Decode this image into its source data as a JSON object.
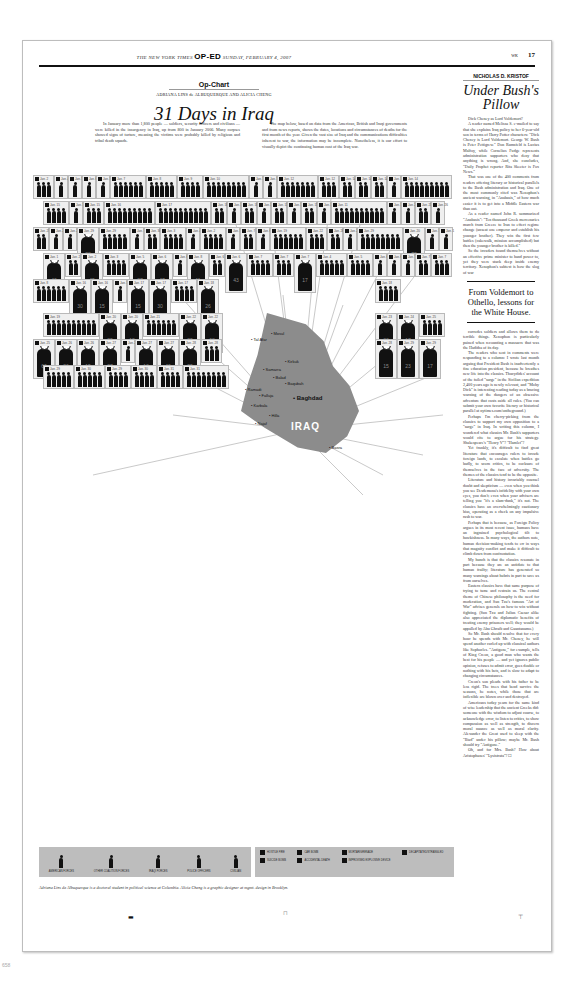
{
  "masthead": {
    "paper": "THE NEW YORK TIMES",
    "section": "OP-ED",
    "date": "SUNDAY, FEBRUARY 4, 2007",
    "section_code": "WK",
    "page": "17"
  },
  "opchart": {
    "kicker": "Op-Chart",
    "byline": "ADRIANA LINS de ALBUQUERQUE AND ALICIA CHENG",
    "title": "31 Days in Iraq",
    "intro": [
      "In January more than 1,800 people — soldiers, security officers and civilians — were killed in the insurgency in Iraq, up from 800 in January 2006. Many corpses showed signs of torture, meaning the victims were probably killed by religious and tribal death squads.",
      "The map below, based on data from the American, British and Iraqi governments and from news reports, shows the dates, locations and circumstances of deaths for the first month of the year. Given the vast size of Iraq and the communications difficulties inherent to war, the information may be incomplete. Nonetheless, it is our effort to visually depict the continuing human cost of the Iraq war."
    ],
    "map": {
      "country_label": "IRAQ",
      "cities": [
        "Mosul",
        "Tal Afar",
        "Kirkuk",
        "Samarra",
        "Baqubah",
        "Ramadi",
        "Falluja",
        "Baghdad",
        "Karbala",
        "Hilla",
        "Najaf",
        "Balad",
        "Basra"
      ]
    },
    "cells": [
      {
        "date": "Jan. 2",
        "n": 3
      },
      {
        "date": "Jan. 4",
        "n": 1
      },
      {
        "date": "Jan. 5",
        "n": 1
      },
      {
        "date": "Jan. 6",
        "n": 1
      },
      {
        "date": "Jan. 7",
        "n": 1
      },
      {
        "date": "Jan. 7",
        "n": 6
      },
      {
        "date": "Jan. 8",
        "n": 5
      },
      {
        "date": "Jan. 9",
        "n": 4
      },
      {
        "date": "Jan. 10",
        "n": 8
      },
      {
        "date": "Jan. 11",
        "n": 1
      },
      {
        "date": "Jan. 13",
        "n": 1
      },
      {
        "date": "Jan. 12",
        "n": 7
      },
      {
        "date": "Jan. 12",
        "n": 3
      },
      {
        "date": "Jan. 14",
        "n": 2
      },
      {
        "date": "Jan. 14",
        "n": 2
      },
      {
        "date": "Jan. 14",
        "n": 2
      },
      {
        "date": "Jan. 14",
        "n": 1
      },
      {
        "date": "Jan. 14",
        "n": 9
      },
      {
        "date": "Jan. 15",
        "n": 4
      },
      {
        "date": "Jan. 15",
        "n": 1
      },
      {
        "date": "Jan. 15",
        "n": 3
      },
      {
        "date": "Jan. 16",
        "n": 9
      },
      {
        "date": "Jan. 17",
        "n": 10
      },
      {
        "date": "Jan. 18",
        "n": 2
      },
      {
        "date": "Jan. 18",
        "n": 1
      },
      {
        "date": "Jan. 18",
        "n": 2
      },
      {
        "date": "Jan. 3",
        "n": 1
      },
      {
        "date": "Jan. 13",
        "n": 2
      },
      {
        "date": "Jan. 14",
        "n": 1
      },
      {
        "date": "Jan. 15",
        "n": 2
      },
      {
        "date": "Jan. 16",
        "n": 1
      },
      {
        "date": "Jan. 11",
        "n": 10
      },
      {
        "date": "Jan. 19",
        "n": 1
      },
      {
        "date": "Jan. 21",
        "n": 1
      },
      {
        "date": "Jan. 23",
        "n": 2
      },
      {
        "date": "Jan. 26",
        "n": 1
      },
      {
        "date": "Jan. 27",
        "n": 2
      },
      {
        "date": "Jan. 28",
        "n": 1
      },
      {
        "date": "Jan. 29",
        "n": 1
      },
      {
        "date": "Jan. 29",
        "big": 28
      },
      {
        "date": "Jan. 29",
        "n": 5
      },
      {
        "date": "Jan. 7",
        "n": 1
      },
      {
        "date": "Jan. 30",
        "n": 2
      },
      {
        "date": "Jan. 3",
        "n": 4
      },
      {
        "date": "Jan. 4",
        "n": 1
      },
      {
        "date": "Jan. 2",
        "n": 4
      },
      {
        "date": "Jan. 1",
        "n": 1
      },
      {
        "date": "Jan. 7",
        "n": 2
      },
      {
        "date": "Jan. 6",
        "n": 1
      },
      {
        "date": "Jan. 19",
        "n": 6
      },
      {
        "date": "Jan. 22",
        "n": 3
      },
      {
        "date": "Jan. 26",
        "n": 2
      },
      {
        "date": "Jan. 28",
        "n": 1
      },
      {
        "date": "Jan. 29",
        "n": 8
      },
      {
        "date": "Jan. 20",
        "big": 72
      },
      {
        "date": "Jan. 1",
        "n": 1
      },
      {
        "date": "Jan. 1",
        "n": 1
      },
      {
        "date": "Jan. 1",
        "big": 40
      },
      {
        "date": "Jan. 2",
        "n": 2
      },
      {
        "date": "Jan. 2",
        "big": 45
      },
      {
        "date": "Jan. 3",
        "n": 4
      },
      {
        "date": "Jan. 5",
        "big": 27
      },
      {
        "date": "Jan. 6",
        "big": 47
      },
      {
        "date": "Jan. 6",
        "n": 1
      },
      {
        "date": "Jan. 8",
        "big": 11
      },
      {
        "date": "Jan. 6",
        "n": 2
      },
      {
        "date": "Jan. 6",
        "big": 43
      },
      {
        "date": "Jan. 7",
        "n": 4
      },
      {
        "date": "Jan. 7",
        "n": 3
      },
      {
        "date": "Jan. 7",
        "big": 17
      },
      {
        "date": "Jan. 4",
        "n": 5
      },
      {
        "date": "Jan. 5",
        "n": 4
      },
      {
        "date": "Jan. 6",
        "n": 1
      },
      {
        "date": "Jan. 6",
        "n": 1
      },
      {
        "date": "Jan. 7",
        "n": 1
      },
      {
        "date": "Jan. 7",
        "n": 2
      },
      {
        "date": "Jan. 7",
        "n": 3
      },
      {
        "date": "Jan. 8",
        "n": 6
      },
      {
        "date": "Jan. 16",
        "big": 30
      },
      {
        "date": "Jan. 16",
        "big": 15
      },
      {
        "date": "Jan. 17",
        "n": 1
      },
      {
        "date": "Jan. 17",
        "big": 15
      },
      {
        "date": "Jan. 17",
        "big": 30
      },
      {
        "date": "Jan. 17",
        "n": 4
      },
      {
        "date": "Jan. 18",
        "big": 26
      },
      {
        "date": "Jan. 18",
        "n": 4
      },
      {
        "date": "Jan. 19",
        "n": 10
      },
      {
        "date": "Jan. 20",
        "big": 29
      },
      {
        "date": "Jan. 20",
        "big": 12
      },
      {
        "date": "Jan. 21",
        "n": 6
      },
      {
        "date": "Jan. 22",
        "big": 29
      },
      {
        "date": "Jan. 22",
        "big": 68
      },
      {
        "date": "Jan. 23",
        "big": 33
      },
      {
        "date": "Jan. 24",
        "big": 17
      },
      {
        "date": "Jan. 25",
        "n": 4
      },
      {
        "date": "Jan. 25",
        "big": 60
      },
      {
        "date": "Jan. 26",
        "big": 26
      },
      {
        "date": "Jan. 26",
        "big": 15
      },
      {
        "date": "Jan. 27",
        "big": 27
      },
      {
        "date": "Jan. 26",
        "n": 1
      },
      {
        "date": "Jan. 27",
        "big": 13
      },
      {
        "date": "Jan. 27",
        "big": 40
      },
      {
        "date": "Jan. 28",
        "big": 29
      },
      {
        "date": "Jan. 28",
        "n": 3
      },
      {
        "date": "Jan. 28",
        "big": 15
      },
      {
        "date": "Jan. 29",
        "big": 23
      },
      {
        "date": "Jan. 29",
        "big": 17
      },
      {
        "date": "Jan. 29",
        "n": 5
      },
      {
        "date": "Jan. 30",
        "n": 5
      },
      {
        "date": "Jan. 29",
        "n": 4
      },
      {
        "date": "Jan. 30",
        "n": 4
      },
      {
        "date": "Jan. 31",
        "n": 4
      },
      {
        "date": "Jan. 31",
        "n": 8
      }
    ]
  },
  "legend": {
    "forces": [
      "AMERICAN FORCES",
      "OTHER COALITION FORCES",
      "IRAQI FORCES",
      "POLICE OFFICERS",
      "CIVILIAN"
    ],
    "causes": [
      "HOSTILE FIRE",
      "CAR BOMB",
      "MORTAR/GRENADE",
      "DECAPITATED/STRANGLED",
      "SUICIDE BOMB",
      "ACCIDENTAL DEATH",
      "IMPROVISED EXPLOSIVE DEVICE"
    ]
  },
  "credit": "Adriana Lins de Albuquerque is a doctoral student in political science at Columbia. Alicia Cheng is a graphic designer at mgmt. design in Brooklyn.",
  "column": {
    "author": "NICHOLAS D. KRISTOF",
    "headline": "Under Bush's Pillow",
    "pull_quote": "From Voldemort to Othello, lessons for the White House.",
    "body_top": [
      "Dick Cheney as Lord Voldemort?",
      "A reader named Melissa S. e-mailed to say that she explains Iraq policy to her 6-year-old son in terms of Harry Potter characters: \"Dick Cheney is Lord Voldemort. George W. Bush is Peter Pettigrew.\" Don Rumsfeld is Lucius Malfoy, while Cornelius Fudge represents administration supporters who deny that anything is wrong. And, she concludes, \"Daily Prophet reporter Rita Skeeter is Fox News.\"",
      "That was one of the 400 comments from readers offering literary or historical parallels to the Bush administration and Iraq. One of the most commonly cited was Xenophon's ancient warning, in \"Anabasis,\" of how much easier it is to get into a Middle Eastern war than out.",
      "As a reader named John R. summarized \"Anabasis\": \"Ten thousand Greek mercenaries march from Greece to Iran to effect regime change (unseat one emperor and establish his younger brother). They win the first few battles (cakewalk, mission accomplished) but then the younger brother is killed.\"",
      "So the invaders found themselves without an effective prime minister to hand power to, yet they were stuck deep inside enemy territory. Xenophon's subtext is how the slog of war"
    ],
    "body_bottom": [
      "corrodes soldiers and allows them to do terrible things. Xenophon is particularly pained when recounting a massacre that was the Haditha of its day.",
      "The readers who sent in comments were responding to a column: I wrote last month arguing that President Bush is inadvertently a fine education president, because he breathes new life into the classics. Thucydides' account of the failed \"surge\" in the Sicilian expedition 2,400 years ago is newly relevant, and \"Moby Dick\" is interesting reading today as a bracing warning of the dangers of an obsessive adventure that casts aside all rules. (You can submit your own favorite literary or historical parallel at nytimes.com/ontheground.)",
      "Perhaps I'm cherry-picking from the classics to support my own opposition to a \"surge\" in Iraq. In writing this column, I wondered what classics Mr. Bush's supporters would cite to argue for his strategy. Shakespeare's \"Henry V\"? \"Hamlet\"?",
      "Yet frankly, it's difficult to find great literature that encourages rulers to invade foreign lands, to escalate when battles go badly, to scorn critics, to be cocksure of themselves in the face of adversity. The themes of the classics tend to be the opposite.",
      "Literature and history invariably counsel doubt and skepticism — even when you think you see Desdemona's infidelity with your own eyes, you don't; even when your advisers are telling you \"it's a slam-dunk,\" it's not. The classics have an overwhelmingly cautionary bias, operating as a check on any impulsive rush to war.",
      "Perhaps that is because, as Foreign Policy argues in its most recent issue, humans have an ingrained psychological tilt to hawkishness. In many ways, the authors note, human decision-making tends to err in ways that magnify conflict and make it difficult to climb down from confrontation.",
      "My hunch is that the classics resonate in part because they are an antidote to that human frailty; literature has generated so many warnings about hubris in part to save us from ourselves.",
      "Eastern classics have that same purpose of trying to tame and restrain us. The central theme of Chinese philosophy is the need for moderation, and Sun Tzu's famous \"Art of War\" advises generals on how to win without fighting. (Sun Tzu and Julius Caesar alike also appreciated the diplomatic benefits of treating enemy prisoners well; they would be appalled by Abu Ghraib and Guantanamo.)",
      "So Mr. Bush should resolve that for every hour he spends with Mr. Cheney, he will spend another curled up with classical authors like Sophocles. \"Antigone,\" for example, tells of King Creon, a good man who wants the best for his people — and yet ignores public opinion, refuses to admit error, goes double or nothing with his bets, and is slow to adapt to changing circumstances.",
      "Creon's son pleads with his father to be less rigid. The trees that bend survive the seasons, he notes, while those that are inflexible are blown over and destroyed.",
      "Americans today yearn for the same kind of wise leadership that the ancient Greeks did: someone with the wisdom to adjust course, to acknowledge error, to listen to critics, to show compassion as well as strength, to discern moral nuance as well as moral clarity. Alexander the Great used to sleep with the \"Iliad\" under his pillow; maybe Mr. Bush should try \"Antigone.\"",
      "Oh, and for Mrs. Bush? How about Aristophanes' \"Lysistrata\"? ☐"
    ]
  },
  "page_number": "658"
}
